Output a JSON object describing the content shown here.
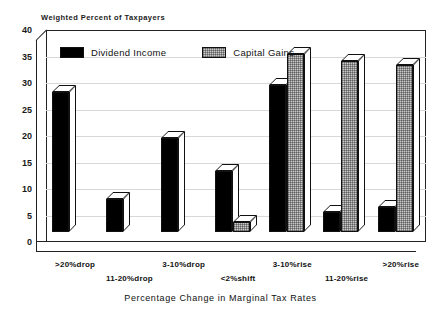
{
  "chart_data": {
    "type": "bar",
    "title": "",
    "ylabel": "Weighted Percent of Taxpayers",
    "xlabel": "Percentage Change in Marginal Tax Rates",
    "ylim": [
      0,
      40
    ],
    "yticks": [
      0,
      5,
      10,
      15,
      20,
      25,
      30,
      35,
      40
    ],
    "grid": true,
    "legend_position": "top-left-inside",
    "categories": [
      ">20%drop",
      "11-20%drop",
      "3-10%drop",
      "<2%shift",
      "3-10%rise",
      "11-20%rise",
      ">20%rise"
    ],
    "series": [
      {
        "name": "Dividend Income",
        "color": "#000000",
        "values": [
          26.5,
          6.3,
          17.8,
          11.5,
          27.8,
          3.7,
          4.7
        ]
      },
      {
        "name": "Capital Gains",
        "color": "#c8c8c8",
        "values": [
          0,
          0,
          0,
          1.8,
          33.5,
          32.3,
          31.5
        ]
      }
    ]
  },
  "axis": {
    "y_title": "Weighted Percent of Taxpayers",
    "x_title": "Percentage Change in Marginal Tax Rates"
  },
  "legend": {
    "items": [
      {
        "label": "Dividend Income"
      },
      {
        "label": "Capital Gains"
      }
    ]
  }
}
